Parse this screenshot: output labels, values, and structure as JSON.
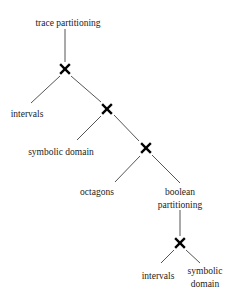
{
  "diagram": {
    "type": "tree",
    "nodes": {
      "root": {
        "label": "trace partitioning"
      },
      "leaf1": {
        "label": "intervals"
      },
      "leaf2": {
        "label": "symbolic domain"
      },
      "leaf3": {
        "label": "octagons"
      },
      "inner": {
        "line1": "boolean",
        "line2": "partitioning"
      },
      "leaf4": {
        "label": "intervals"
      },
      "leaf5": {
        "line1": "symbolic",
        "line2": "domain"
      }
    },
    "product_symbol": "cross-icon",
    "edges": [
      [
        "root",
        "x1"
      ],
      [
        "x1",
        "leaf1"
      ],
      [
        "x1",
        "x2"
      ],
      [
        "x2",
        "leaf2"
      ],
      [
        "x2",
        "x3"
      ],
      [
        "x3",
        "leaf3"
      ],
      [
        "x3",
        "inner"
      ],
      [
        "inner",
        "x4"
      ],
      [
        "x4",
        "leaf4"
      ],
      [
        "x4",
        "leaf5"
      ]
    ]
  }
}
